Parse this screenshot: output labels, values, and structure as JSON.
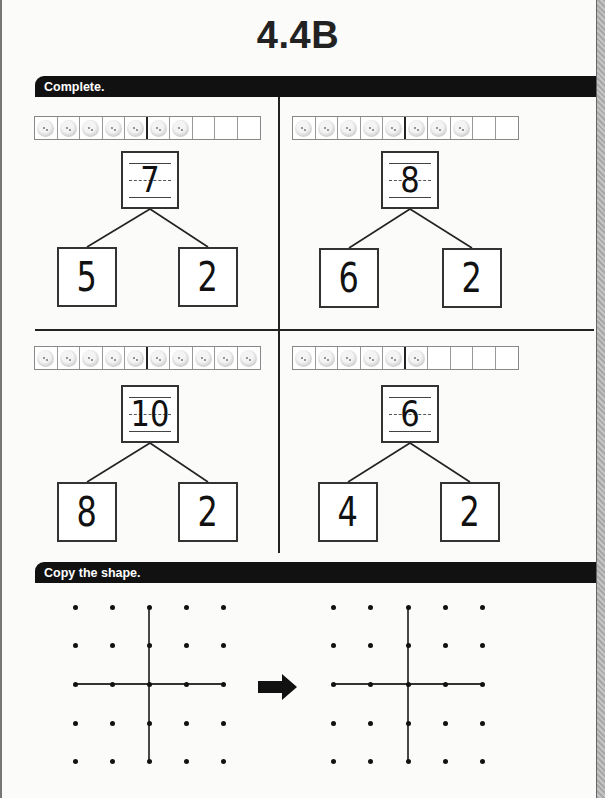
{
  "page": {
    "title": "4.4B"
  },
  "sections": [
    {
      "label": "Complete."
    },
    {
      "label": "Copy the shape."
    }
  ],
  "number_bonds": [
    {
      "ten_frame": {
        "cells": 10,
        "filled": 7
      },
      "whole": "7",
      "parts": [
        "5",
        "2"
      ]
    },
    {
      "ten_frame": {
        "cells": 10,
        "filled": 8
      },
      "whole": "8",
      "parts": [
        "6",
        "2"
      ]
    },
    {
      "ten_frame": {
        "cells": 10,
        "filled": 10
      },
      "whole": "10",
      "parts": [
        "8",
        "2"
      ]
    },
    {
      "ten_frame": {
        "cells": 10,
        "filled": 6
      },
      "whole": "6",
      "parts": [
        "4",
        "2"
      ]
    }
  ],
  "copy_shape": {
    "grid_size": [
      5,
      5
    ],
    "model": {
      "shape": "plus",
      "vertical_col": 3,
      "horizontal_row": 3
    },
    "copy": {
      "shape": "plus",
      "vertical_col": 3,
      "horizontal_row": 3
    },
    "arrow_icon": "right-arrow"
  }
}
